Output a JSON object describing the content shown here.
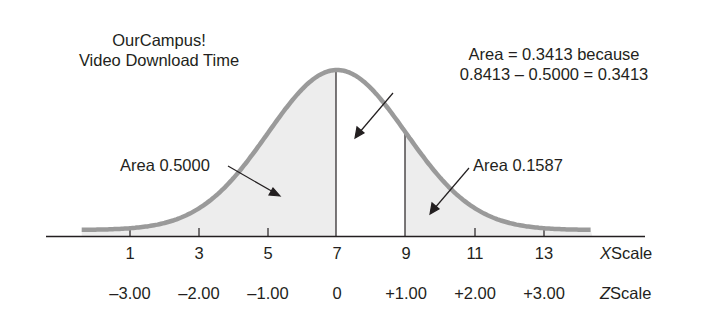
{
  "title": [
    "OurCampus!",
    "Video Download Time"
  ],
  "annotations": {
    "middle": [
      "Area = 0.3413 because",
      "0.8413 – 0.5000 = 0.3413"
    ],
    "left": "Area 0.5000",
    "right": "Area 0.1587"
  },
  "x_scale": {
    "name_var": "X",
    "name_word": "Scale",
    "ticks": [
      "1",
      "3",
      "5",
      "7",
      "9",
      "11",
      "13"
    ]
  },
  "z_scale": {
    "name_var": "Z",
    "name_word": "Scale",
    "ticks": [
      "–3.00",
      "–2.00",
      "–1.00",
      "0",
      "+1.00",
      "+2.00",
      "+3.00"
    ]
  },
  "colors": {
    "curve": "#9a9a9a",
    "shade": "#ededed",
    "text": "#231f20",
    "axis": "#231f20"
  },
  "chart_data": {
    "type": "area",
    "title": "OurCampus! Video Download Time",
    "distribution": "normal",
    "mean": 7,
    "std_dev": 2,
    "x_ticks": [
      1,
      3,
      5,
      7,
      9,
      11,
      13
    ],
    "z_ticks": [
      -3,
      -2,
      -1,
      0,
      1,
      2,
      3
    ],
    "shaded_regions": [
      {
        "from": "-inf",
        "to": 7,
        "area": 0.5,
        "label": "Area 0.5000"
      },
      {
        "from": 9,
        "to": "+inf",
        "area": 0.1587,
        "label": "Area 0.1587"
      }
    ],
    "unshaded_region": {
      "from": 7,
      "to": 9,
      "area": 0.3413,
      "label": "Area = 0.3413 because 0.8413 – 0.5000 = 0.3413"
    },
    "xlabel": "X Scale",
    "zlabel": "Z Scale"
  }
}
